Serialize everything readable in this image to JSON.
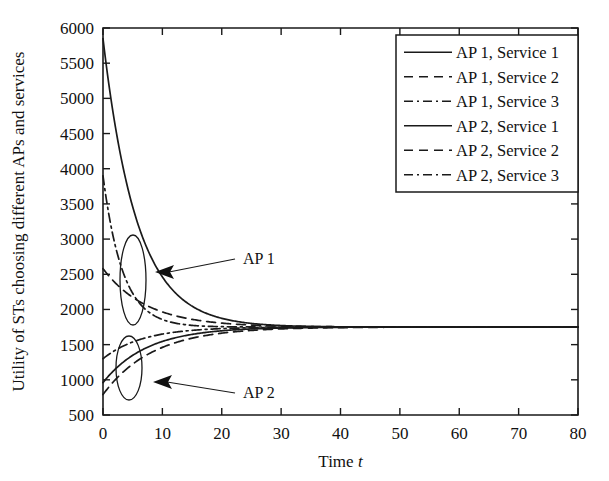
{
  "chart_data": {
    "type": "line",
    "title": "",
    "xlabel": "Time t",
    "xlabel_plain": "Time",
    "xlabel_italic": "t",
    "ylabel": "Utility of STs choosing different APs and services",
    "xlim": [
      0,
      80
    ],
    "ylim": [
      500,
      6000
    ],
    "xticks": [
      0,
      10,
      20,
      30,
      40,
      50,
      60,
      70,
      80
    ],
    "yticks": [
      500,
      1000,
      1500,
      2000,
      2500,
      3000,
      3500,
      4000,
      4500,
      5000,
      5500,
      6000
    ],
    "grid": false,
    "legend_position": "top-right",
    "converged_value": 1750,
    "series": [
      {
        "name": "AP 1, Service 1",
        "ap": "AP 1",
        "service": "Service 1",
        "linestyle": "solid",
        "color": "#1a1a1a",
        "start_value": 5850,
        "end_value": 1750,
        "decay_rate": 0.175,
        "group": "AP 1"
      },
      {
        "name": "AP 1, Service 2",
        "ap": "AP 1",
        "service": "Service 2",
        "linestyle": "dashed",
        "color": "#1a1a1a",
        "start_value": 2580,
        "end_value": 1750,
        "decay_rate": 0.135,
        "group": "AP 1"
      },
      {
        "name": "AP 1, Service 3",
        "ap": "AP 1",
        "service": "Service 3",
        "linestyle": "dashdot",
        "color": "#1a1a1a",
        "start_value": 3900,
        "end_value": 1750,
        "decay_rate": 0.3,
        "group": "AP 1"
      },
      {
        "name": "AP 2, Service 1",
        "ap": "AP 2",
        "service": "Service 1",
        "linestyle": "solid",
        "color": "#1a1a1a",
        "start_value": 960,
        "end_value": 1750,
        "decay_rate": 0.135,
        "group": "AP 2"
      },
      {
        "name": "AP 2, Service 2",
        "ap": "AP 2",
        "service": "Service 2",
        "linestyle": "dashed",
        "color": "#1a1a1a",
        "start_value": 790,
        "end_value": 1750,
        "decay_rate": 0.12,
        "group": "AP 2"
      },
      {
        "name": "AP 2, Service 3",
        "ap": "AP 2",
        "service": "Service 3",
        "linestyle": "dashdot",
        "color": "#1a1a1a",
        "start_value": 1300,
        "end_value": 1750,
        "decay_rate": 0.15,
        "group": "AP 2"
      }
    ],
    "annotations": [
      {
        "label": "AP 1",
        "text_x": 243,
        "text_y": 264,
        "arrow_tip_x": 155,
        "arrow_tip_y": 272,
        "ellipse_cx": 133,
        "ellipse_cy": 280,
        "ellipse_rx": 13,
        "ellipse_ry": 45
      },
      {
        "label": "AP 2",
        "text_x": 243,
        "text_y": 398,
        "arrow_tip_x": 153,
        "arrow_tip_y": 382,
        "ellipse_cx": 129,
        "ellipse_cy": 368,
        "ellipse_rx": 13,
        "ellipse_ry": 32
      }
    ]
  },
  "legend": {
    "entries": [
      {
        "label": "AP 1, Service 1",
        "linestyle": "solid"
      },
      {
        "label": "AP 1, Service 2",
        "linestyle": "dashed"
      },
      {
        "label": "AP 1, Service 3",
        "linestyle": "dashdot"
      },
      {
        "label": "AP 2, Service 1",
        "linestyle": "solid"
      },
      {
        "label": "AP 2, Service 2",
        "linestyle": "dashed"
      },
      {
        "label": "AP 2, Service 3",
        "linestyle": "dashdot"
      }
    ]
  }
}
